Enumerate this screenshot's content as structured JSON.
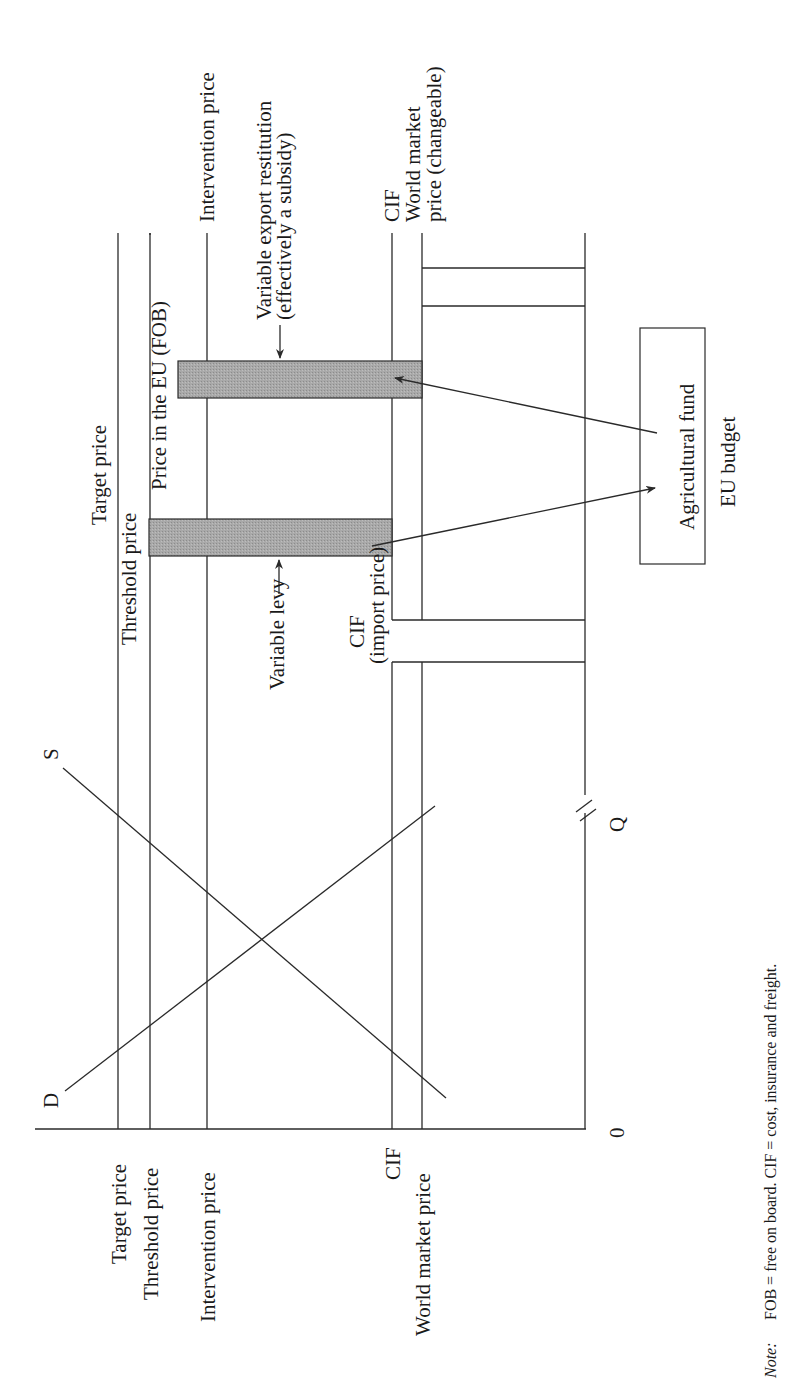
{
  "figure": {
    "orientation": "rotated-90-ccw",
    "colors": {
      "line": "#2a2a2a",
      "bar_fill": "#a9a9a9",
      "text": "#1a1a1a",
      "background": "#ffffff"
    }
  },
  "axes": {
    "origin_label": "0",
    "quantity_label": "Q",
    "axis_break_marker": "//"
  },
  "curves": {
    "demand_label": "D",
    "supply_label": "S"
  },
  "price_axis_labels": {
    "target": "Target price",
    "threshold": "Threshold price",
    "intervention": "Intervention price",
    "cif": "CIF",
    "world_market": "World market price"
  },
  "top_labels": {
    "target": "Target price",
    "threshold": "Threshold price",
    "price_in_eu": "Price in the EU (FOB)",
    "intervention": "Intervention price",
    "cif_right": "CIF",
    "world_market_line1": "World market",
    "world_market_line2": "price (changeable)"
  },
  "annotations": {
    "variable_levy": "Variable levy",
    "cif_import_line1": "CIF",
    "cif_import_line2": "(import price)",
    "export_restitution_line1": "Variable export restitution",
    "export_restitution_line2": "(effectively a subsidy)"
  },
  "budget_box": {
    "fund_label": "Agricultural fund",
    "budget_label": "EU budget"
  },
  "note": {
    "prefix": "Note:",
    "text": "FOB = free on board. CIF = cost, insurance and freight."
  }
}
